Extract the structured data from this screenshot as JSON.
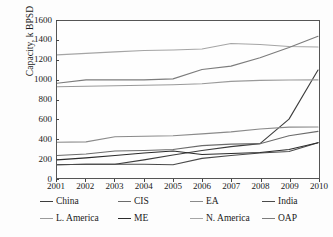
{
  "chart_data": {
    "type": "line",
    "title": "",
    "xlabel": "",
    "ylabel": "Capacity, k BPSD",
    "x": [
      2001,
      2002,
      2003,
      2004,
      2005,
      2006,
      2007,
      2008,
      2009,
      2010
    ],
    "xtick_labels": [
      "2001",
      "2002",
      "2003",
      "2004",
      "2005",
      "2006",
      "2007",
      "2008",
      "2009",
      "2010"
    ],
    "ytick_labels": [
      "0",
      "200",
      "400",
      "600",
      "800",
      "1000",
      "1200",
      "1400",
      "1600"
    ],
    "yticks": [
      0,
      200,
      400,
      600,
      800,
      1000,
      1200,
      1400,
      1600
    ],
    "ylim": [
      0,
      1600
    ],
    "xlim": [
      2001,
      2010
    ],
    "grid": false,
    "legend_position": "bottom",
    "series": [
      {
        "name": "China",
        "color": "#3d3d3d",
        "values": [
          135,
          140,
          140,
          185,
          235,
          280,
          320,
          350,
          600,
          1100
        ]
      },
      {
        "name": "CIS",
        "color": "#6b6b6b",
        "values": [
          230,
          245,
          275,
          280,
          290,
          330,
          345,
          350,
          430,
          475
        ]
      },
      {
        "name": "EA",
        "color": "#8a8a8a",
        "values": [
          365,
          368,
          420,
          425,
          430,
          450,
          470,
          500,
          518,
          520
        ]
      },
      {
        "name": "India",
        "color": "#4a4a4a",
        "values": [
          135,
          140,
          140,
          140,
          135,
          200,
          230,
          255,
          270,
          360
        ]
      },
      {
        "name": "L. America",
        "color": "#9a9a9a",
        "values": [
          930,
          935,
          940,
          945,
          950,
          960,
          985,
          995,
          998,
          1000
        ]
      },
      {
        "name": "ME",
        "color": "#2b2b2b",
        "values": [
          185,
          205,
          230,
          255,
          275,
          240,
          250,
          260,
          290,
          360
        ]
      },
      {
        "name": "N. America",
        "color": "#a5a5a5",
        "values": [
          1255,
          1270,
          1285,
          1300,
          1305,
          1315,
          1370,
          1360,
          1340,
          1335
        ]
      },
      {
        "name": "OAP",
        "color": "#7c7c7c",
        "values": [
          965,
          1000,
          1000,
          1000,
          1010,
          1105,
          1140,
          1225,
          1330,
          1445
        ]
      }
    ]
  },
  "legend": {
    "rows": [
      [
        {
          "label": "China",
          "color": "#3d3d3d"
        },
        {
          "label": "CIS",
          "color": "#6b6b6b"
        },
        {
          "label": "EA",
          "color": "#8a8a8a"
        },
        {
          "label": "India",
          "color": "#4a4a4a"
        }
      ],
      [
        {
          "label": "L. America",
          "color": "#9a9a9a"
        },
        {
          "label": "ME",
          "color": "#2b2b2b"
        },
        {
          "label": "N. America",
          "color": "#a5a5a5"
        },
        {
          "label": "OAP",
          "color": "#7c7c7c"
        }
      ]
    ]
  }
}
